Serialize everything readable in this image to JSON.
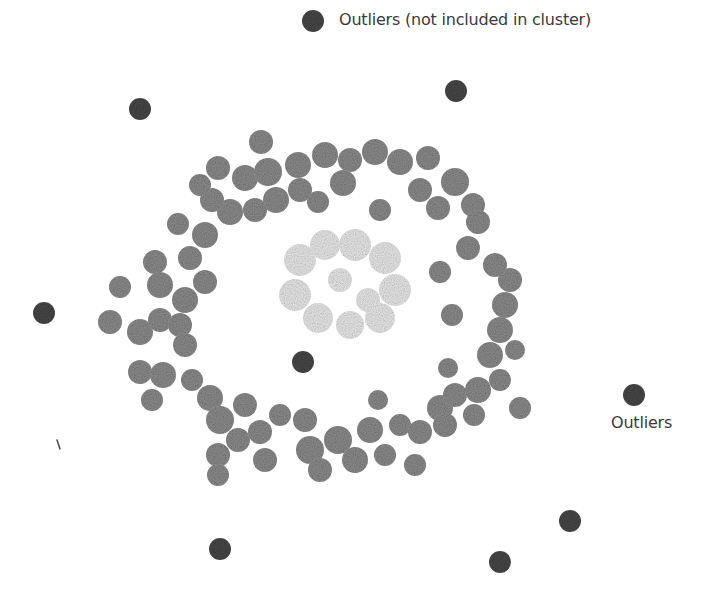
{
  "diagram": {
    "labels": {
      "outliers_not_included": "Outliers (not included in cluster)",
      "outliers": "Outliers"
    },
    "colors": {
      "background": "#ffffff",
      "outlier": "#4a4a4a",
      "outer_cluster": "#8f8f8f",
      "inner_cluster": "#ececec",
      "text": "#3a3a3a"
    },
    "outlier_radius": 11,
    "outliers": [
      {
        "x": 313,
        "y": 21
      },
      {
        "x": 456,
        "y": 91
      },
      {
        "x": 140,
        "y": 109
      },
      {
        "x": 44,
        "y": 313
      },
      {
        "x": 303,
        "y": 362
      },
      {
        "x": 634,
        "y": 395
      },
      {
        "x": 570,
        "y": 521
      },
      {
        "x": 220,
        "y": 549
      },
      {
        "x": 500,
        "y": 562
      }
    ],
    "outer_cluster_blobs": [
      {
        "x": 261,
        "y": 142,
        "r": 12
      },
      {
        "x": 218,
        "y": 168,
        "r": 12
      },
      {
        "x": 245,
        "y": 178,
        "r": 13
      },
      {
        "x": 268,
        "y": 172,
        "r": 14
      },
      {
        "x": 298,
        "y": 165,
        "r": 13
      },
      {
        "x": 325,
        "y": 155,
        "r": 13
      },
      {
        "x": 350,
        "y": 160,
        "r": 12
      },
      {
        "x": 375,
        "y": 152,
        "r": 13
      },
      {
        "x": 400,
        "y": 162,
        "r": 13
      },
      {
        "x": 428,
        "y": 158,
        "r": 12
      },
      {
        "x": 455,
        "y": 182,
        "r": 14
      },
      {
        "x": 473,
        "y": 205,
        "r": 12
      },
      {
        "x": 478,
        "y": 222,
        "r": 12
      },
      {
        "x": 318,
        "y": 202,
        "r": 11
      },
      {
        "x": 380,
        "y": 210,
        "r": 11
      },
      {
        "x": 343,
        "y": 183,
        "r": 13
      },
      {
        "x": 420,
        "y": 190,
        "r": 12
      },
      {
        "x": 438,
        "y": 208,
        "r": 12
      },
      {
        "x": 300,
        "y": 190,
        "r": 12
      },
      {
        "x": 276,
        "y": 200,
        "r": 13
      },
      {
        "x": 255,
        "y": 210,
        "r": 12
      },
      {
        "x": 230,
        "y": 212,
        "r": 13
      },
      {
        "x": 212,
        "y": 200,
        "r": 12
      },
      {
        "x": 200,
        "y": 185,
        "r": 11
      },
      {
        "x": 178,
        "y": 224,
        "r": 11
      },
      {
        "x": 205,
        "y": 235,
        "r": 13
      },
      {
        "x": 190,
        "y": 258,
        "r": 12
      },
      {
        "x": 155,
        "y": 262,
        "r": 12
      },
      {
        "x": 160,
        "y": 285,
        "r": 13
      },
      {
        "x": 185,
        "y": 300,
        "r": 13
      },
      {
        "x": 205,
        "y": 282,
        "r": 12
      },
      {
        "x": 120,
        "y": 287,
        "r": 11
      },
      {
        "x": 110,
        "y": 322,
        "r": 12
      },
      {
        "x": 140,
        "y": 332,
        "r": 13
      },
      {
        "x": 160,
        "y": 320,
        "r": 12
      },
      {
        "x": 180,
        "y": 325,
        "r": 12
      },
      {
        "x": 185,
        "y": 345,
        "r": 12
      },
      {
        "x": 140,
        "y": 372,
        "r": 12
      },
      {
        "x": 163,
        "y": 375,
        "r": 13
      },
      {
        "x": 152,
        "y": 400,
        "r": 11
      },
      {
        "x": 192,
        "y": 380,
        "r": 11
      },
      {
        "x": 210,
        "y": 398,
        "r": 13
      },
      {
        "x": 220,
        "y": 420,
        "r": 14
      },
      {
        "x": 245,
        "y": 405,
        "r": 12
      },
      {
        "x": 218,
        "y": 455,
        "r": 12
      },
      {
        "x": 218,
        "y": 475,
        "r": 11
      },
      {
        "x": 238,
        "y": 440,
        "r": 12
      },
      {
        "x": 260,
        "y": 432,
        "r": 12
      },
      {
        "x": 265,
        "y": 460,
        "r": 12
      },
      {
        "x": 280,
        "y": 415,
        "r": 11
      },
      {
        "x": 305,
        "y": 420,
        "r": 12
      },
      {
        "x": 310,
        "y": 450,
        "r": 14
      },
      {
        "x": 320,
        "y": 470,
        "r": 12
      },
      {
        "x": 338,
        "y": 440,
        "r": 14
      },
      {
        "x": 355,
        "y": 460,
        "r": 13
      },
      {
        "x": 370,
        "y": 430,
        "r": 13
      },
      {
        "x": 385,
        "y": 455,
        "r": 11
      },
      {
        "x": 378,
        "y": 400,
        "r": 10
      },
      {
        "x": 400,
        "y": 425,
        "r": 11
      },
      {
        "x": 420,
        "y": 432,
        "r": 12
      },
      {
        "x": 415,
        "y": 465,
        "r": 11
      },
      {
        "x": 440,
        "y": 408,
        "r": 13
      },
      {
        "x": 445,
        "y": 425,
        "r": 12
      },
      {
        "x": 455,
        "y": 395,
        "r": 12
      },
      {
        "x": 478,
        "y": 390,
        "r": 13
      },
      {
        "x": 474,
        "y": 415,
        "r": 11
      },
      {
        "x": 500,
        "y": 380,
        "r": 11
      },
      {
        "x": 520,
        "y": 408,
        "r": 11
      },
      {
        "x": 448,
        "y": 368,
        "r": 10
      },
      {
        "x": 490,
        "y": 355,
        "r": 13
      },
      {
        "x": 500,
        "y": 330,
        "r": 13
      },
      {
        "x": 505,
        "y": 305,
        "r": 13
      },
      {
        "x": 510,
        "y": 280,
        "r": 12
      },
      {
        "x": 495,
        "y": 265,
        "r": 12
      },
      {
        "x": 468,
        "y": 248,
        "r": 12
      },
      {
        "x": 440,
        "y": 272,
        "r": 11
      },
      {
        "x": 452,
        "y": 315,
        "r": 11
      },
      {
        "x": 515,
        "y": 350,
        "r": 10
      }
    ],
    "inner_cluster_blobs": [
      {
        "x": 300,
        "y": 260,
        "r": 16
      },
      {
        "x": 325,
        "y": 245,
        "r": 15
      },
      {
        "x": 355,
        "y": 245,
        "r": 16
      },
      {
        "x": 385,
        "y": 258,
        "r": 16
      },
      {
        "x": 395,
        "y": 290,
        "r": 16
      },
      {
        "x": 380,
        "y": 318,
        "r": 15
      },
      {
        "x": 350,
        "y": 325,
        "r": 14
      },
      {
        "x": 318,
        "y": 318,
        "r": 15
      },
      {
        "x": 295,
        "y": 295,
        "r": 16
      },
      {
        "x": 340,
        "y": 280,
        "r": 12
      },
      {
        "x": 368,
        "y": 300,
        "r": 12
      }
    ]
  }
}
